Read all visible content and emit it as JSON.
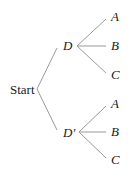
{
  "diagram": {
    "type": "tree",
    "root": {
      "label": "Start"
    },
    "level1": [
      {
        "label": "D",
        "children": [
          "A",
          "B",
          "C"
        ]
      },
      {
        "label": "D'",
        "children": [
          "A",
          "B",
          "C"
        ]
      }
    ],
    "colors": {
      "line": "#9a9a9a",
      "text": "#1a1a1a",
      "background": "#ffffff"
    }
  }
}
